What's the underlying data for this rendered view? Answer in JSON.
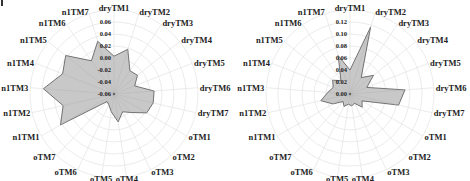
{
  "chart_data": [
    {
      "type": "radar",
      "title": "",
      "axes": [
        "dryTM1",
        "dryTM2",
        "dryTM3",
        "dryTM4",
        "dryTM5",
        "dryTM6",
        "dryTM7",
        "oTM1",
        "oTM2",
        "oTM3",
        "oTM4",
        "oTM5",
        "oTM6",
        "oTM7",
        "n1TM1",
        "n1TM2",
        "n1TM3",
        "n1TM4",
        "n1TM5",
        "n1TM6",
        "n1TM7"
      ],
      "ticks": [
        "-0.06",
        "-0.04",
        "-0.02",
        "0.00",
        "0.02",
        "0.04",
        "0.06"
      ],
      "rlim": [
        -0.06,
        0.06
      ],
      "series": [
        {
          "name": "",
          "values": [
            0.003,
            0.018,
            -0.013,
            -0.01,
            -0.023,
            0.007,
            0.007,
            0.003,
            -0.018,
            -0.027,
            -0.013,
            -0.03,
            -0.04,
            -0.043,
            0.043,
            0.027,
            0.058,
            0.032,
            0.043,
            0.007,
            0.032
          ]
        }
      ],
      "fill_color": "#c8c8c8",
      "line_color": "#555555",
      "grid": true
    },
    {
      "type": "radar",
      "title": "",
      "axes": [
        "dryTM1",
        "dryTM2",
        "dryTM3",
        "dryTM4",
        "dryTM5",
        "dryTM6",
        "dryTM7",
        "oTM1",
        "oTM2",
        "oTM3",
        "oTM4",
        "oTM5",
        "oTM6",
        "oTM7",
        "n1TM1",
        "n1TM2",
        "n1TM3",
        "n1TM4",
        "n1TM5",
        "n1TM6",
        "n1TM7"
      ],
      "ticks": [
        "0.00",
        "0.02",
        "0.04",
        "0.06",
        "0.08",
        "0.10",
        "0.12"
      ],
      "rlim": [
        0,
        0.12
      ],
      "series": [
        {
          "name": "",
          "values": [
            0.04,
            0.117,
            0.033,
            0.05,
            0.03,
            0.092,
            0.083,
            0.023,
            0.03,
            0.017,
            0.02,
            0.017,
            0.023,
            0.017,
            0.033,
            0.05,
            0.037,
            0.03,
            0.037,
            0.027,
            0.067
          ]
        }
      ],
      "fill_color": "#c8c8c8",
      "line_color": "#555555",
      "grid": true
    }
  ]
}
